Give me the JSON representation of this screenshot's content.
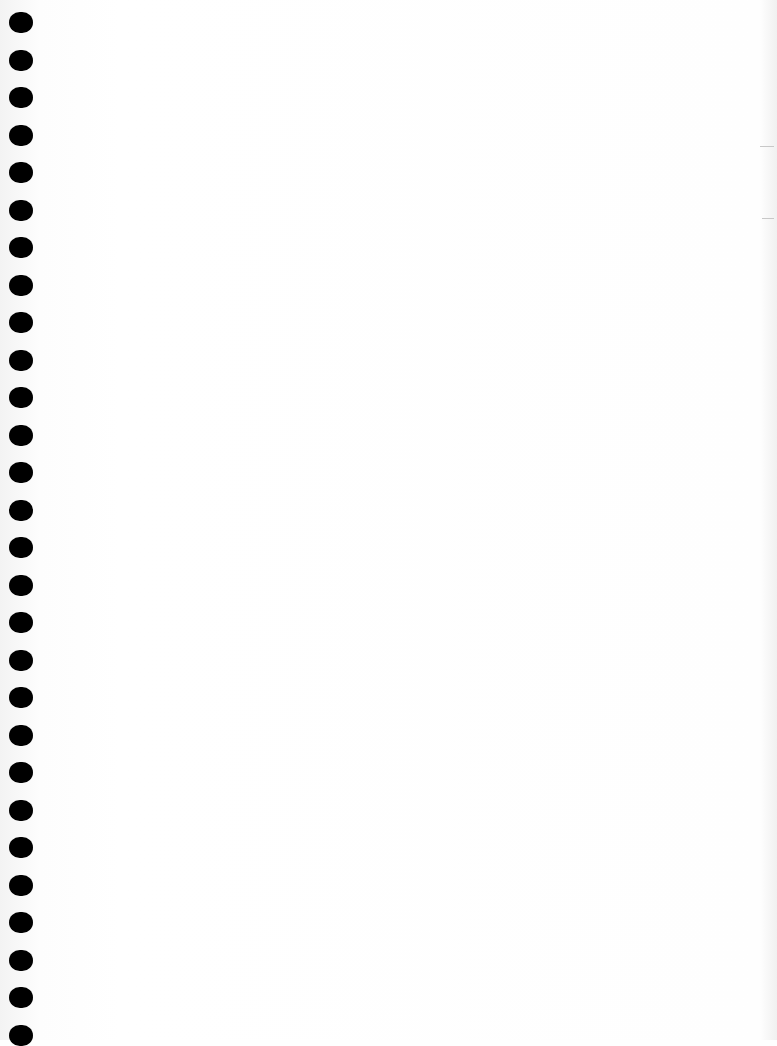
{
  "page": {
    "type": "blank scanned notebook page",
    "background_color": "#fefefe",
    "hole_color": "#000000",
    "hole_count": 28,
    "hole_spacing_px": 37.5,
    "first_hole_top_px": 12
  }
}
